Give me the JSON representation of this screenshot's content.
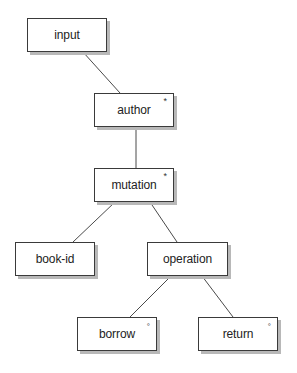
{
  "diagram": {
    "type": "tree",
    "nodes": [
      {
        "id": "input",
        "label": "input",
        "marker": ""
      },
      {
        "id": "author",
        "label": "author",
        "marker": "*"
      },
      {
        "id": "mutation",
        "label": "mutation",
        "marker": "*"
      },
      {
        "id": "book-id",
        "label": "book-id",
        "marker": ""
      },
      {
        "id": "operation",
        "label": "operation",
        "marker": ""
      },
      {
        "id": "borrow",
        "label": "borrow",
        "marker": "°"
      },
      {
        "id": "return",
        "label": "return",
        "marker": "°"
      }
    ],
    "edges": [
      {
        "from": "input",
        "to": "author"
      },
      {
        "from": "author",
        "to": "mutation"
      },
      {
        "from": "mutation",
        "to": "book-id"
      },
      {
        "from": "mutation",
        "to": "operation"
      },
      {
        "from": "operation",
        "to": "borrow"
      },
      {
        "from": "operation",
        "to": "return"
      }
    ],
    "colors": {
      "box_border": "#3a3a3a",
      "box_shadow": "#b8b8b8",
      "edge": "#4a4a4a",
      "text": "#222222",
      "background": "#ffffff"
    }
  }
}
